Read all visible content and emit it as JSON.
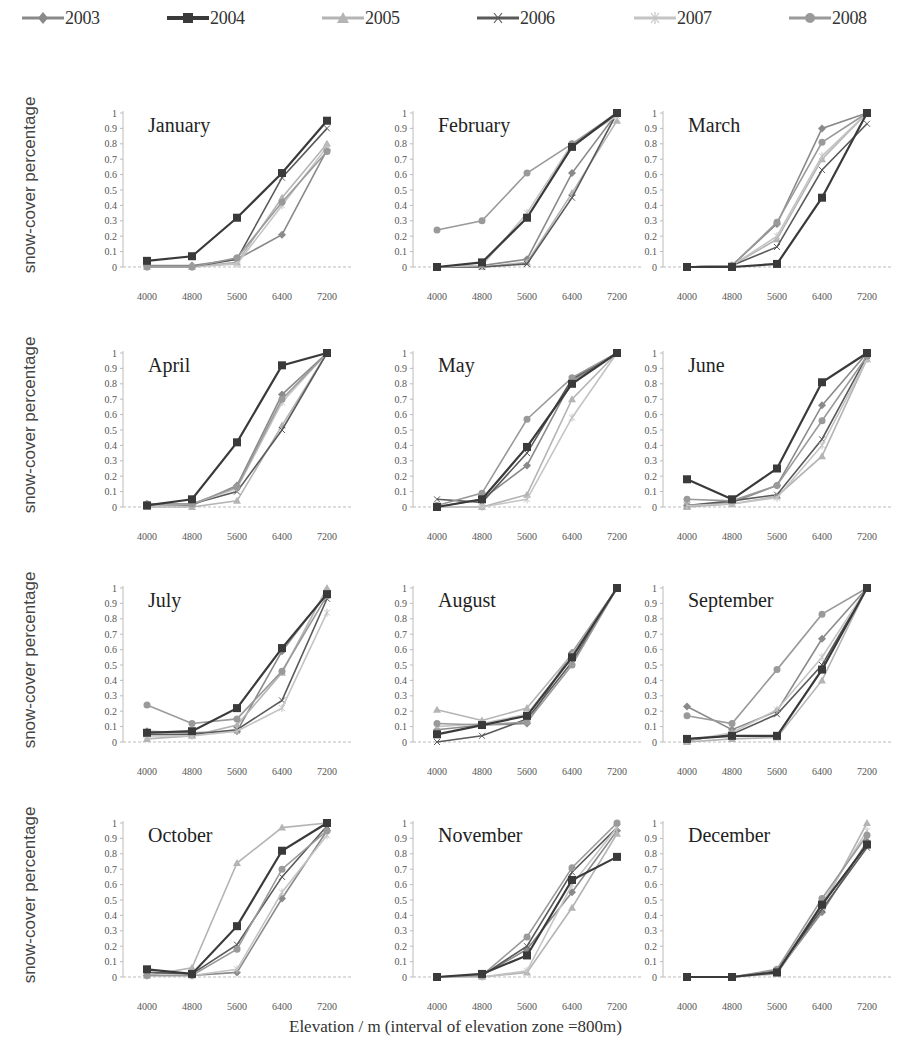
{
  "legend": {
    "items": [
      {
        "label": "2003",
        "color": "#8a8a8a",
        "marker": "diamond"
      },
      {
        "label": "2004",
        "color": "#3a3a3a",
        "marker": "square"
      },
      {
        "label": "2005",
        "color": "#b4b4b4",
        "marker": "triangle"
      },
      {
        "label": "2006",
        "color": "#5a5a5a",
        "marker": "x"
      },
      {
        "label": "2007",
        "color": "#c4c4c4",
        "marker": "star"
      },
      {
        "label": "2008",
        "color": "#9a9a9a",
        "marker": "circle"
      }
    ]
  },
  "ylabel": "snow-cover percentage",
  "xlabel": "Elevation / m (interval of elevation zone =800m)",
  "chart_data": {
    "type": "line",
    "layout": "small-multiples 4x3",
    "x": [
      4000,
      4800,
      5600,
      6400,
      7200
    ],
    "x_tick_labels": [
      "4000",
      "4800",
      "5600",
      "6400",
      "7200"
    ],
    "y_ticks": [
      "0",
      "0.1",
      "0.2",
      "0.3",
      "0.4",
      "0.5",
      "0.6",
      "0.7",
      "0.8",
      "0.9",
      "1"
    ],
    "ylim": [
      0,
      1
    ],
    "ylabel": "snow-cover percentage",
    "xlabel": "Elevation / m (interval of elevation zone =800m)",
    "legend_position": "top",
    "series_names": [
      "2003",
      "2004",
      "2005",
      "2006",
      "2007",
      "2008"
    ],
    "panels": [
      {
        "title": "January",
        "series": [
          {
            "name": "2003",
            "values": [
              0.01,
              0.01,
              0.05,
              0.21,
              0.76
            ]
          },
          {
            "name": "2004",
            "values": [
              0.04,
              0.07,
              0.32,
              0.61,
              0.95
            ]
          },
          {
            "name": "2005",
            "values": [
              0.0,
              0.0,
              0.03,
              0.45,
              0.8
            ]
          },
          {
            "name": "2006",
            "values": [
              0.0,
              0.0,
              0.05,
              0.58,
              0.9
            ]
          },
          {
            "name": "2007",
            "values": [
              0.0,
              0.0,
              0.02,
              0.4,
              0.78
            ]
          },
          {
            "name": "2008",
            "values": [
              0.0,
              0.0,
              0.06,
              0.42,
              0.75
            ]
          }
        ]
      },
      {
        "title": "February",
        "series": [
          {
            "name": "2003",
            "values": [
              0.0,
              0.01,
              0.05,
              0.61,
              1.0
            ]
          },
          {
            "name": "2004",
            "values": [
              0.0,
              0.03,
              0.32,
              0.78,
              1.0
            ]
          },
          {
            "name": "2005",
            "values": [
              0.0,
              0.0,
              0.03,
              0.48,
              0.95
            ]
          },
          {
            "name": "2006",
            "values": [
              0.0,
              0.0,
              0.02,
              0.45,
              1.0
            ]
          },
          {
            "name": "2007",
            "values": [
              0.0,
              0.01,
              0.35,
              0.8,
              0.98
            ]
          },
          {
            "name": "2008",
            "values": [
              0.24,
              0.3,
              0.61,
              0.8,
              1.0
            ]
          }
        ]
      },
      {
        "title": "March",
        "series": [
          {
            "name": "2003",
            "values": [
              0.0,
              0.01,
              0.28,
              0.9,
              1.0
            ]
          },
          {
            "name": "2004",
            "values": [
              0.0,
              0.0,
              0.02,
              0.45,
              1.0
            ]
          },
          {
            "name": "2005",
            "values": [
              0.0,
              0.01,
              0.18,
              0.7,
              1.0
            ]
          },
          {
            "name": "2006",
            "values": [
              0.0,
              0.01,
              0.13,
              0.63,
              0.93
            ]
          },
          {
            "name": "2007",
            "values": [
              0.0,
              0.01,
              0.2,
              0.72,
              1.0
            ]
          },
          {
            "name": "2008",
            "values": [
              0.0,
              0.01,
              0.29,
              0.81,
              1.0
            ]
          }
        ]
      },
      {
        "title": "April",
        "series": [
          {
            "name": "2003",
            "values": [
              0.02,
              0.01,
              0.14,
              0.73,
              1.0
            ]
          },
          {
            "name": "2004",
            "values": [
              0.01,
              0.05,
              0.42,
              0.92,
              1.0
            ]
          },
          {
            "name": "2005",
            "values": [
              0.0,
              0.0,
              0.04,
              0.53,
              1.0
            ]
          },
          {
            "name": "2006",
            "values": [
              0.01,
              0.02,
              0.1,
              0.5,
              1.0
            ]
          },
          {
            "name": "2007",
            "values": [
              0.01,
              0.02,
              0.12,
              0.68,
              1.0
            ]
          },
          {
            "name": "2008",
            "values": [
              0.02,
              0.02,
              0.13,
              0.7,
              1.0
            ]
          }
        ]
      },
      {
        "title": "May",
        "series": [
          {
            "name": "2003",
            "values": [
              0.0,
              0.05,
              0.27,
              0.82,
              1.0
            ]
          },
          {
            "name": "2004",
            "values": [
              0.0,
              0.05,
              0.39,
              0.8,
              1.0
            ]
          },
          {
            "name": "2005",
            "values": [
              0.0,
              0.0,
              0.08,
              0.7,
              1.0
            ]
          },
          {
            "name": "2006",
            "values": [
              0.05,
              0.03,
              0.35,
              0.83,
              1.0
            ]
          },
          {
            "name": "2007",
            "values": [
              0.0,
              0.0,
              0.05,
              0.58,
              1.0
            ]
          },
          {
            "name": "2008",
            "values": [
              0.01,
              0.09,
              0.57,
              0.84,
              1.0
            ]
          }
        ]
      },
      {
        "title": "June",
        "series": [
          {
            "name": "2003",
            "values": [
              0.01,
              0.03,
              0.14,
              0.66,
              1.0
            ]
          },
          {
            "name": "2004",
            "values": [
              0.18,
              0.05,
              0.25,
              0.81,
              1.0
            ]
          },
          {
            "name": "2005",
            "values": [
              0.0,
              0.02,
              0.07,
              0.33,
              0.96
            ]
          },
          {
            "name": "2006",
            "values": [
              0.01,
              0.04,
              0.08,
              0.44,
              0.98
            ]
          },
          {
            "name": "2007",
            "values": [
              0.01,
              0.02,
              0.06,
              0.4,
              0.96
            ]
          },
          {
            "name": "2008",
            "values": [
              0.05,
              0.04,
              0.14,
              0.56,
              0.98
            ]
          }
        ]
      },
      {
        "title": "July",
        "series": [
          {
            "name": "2003",
            "values": [
              0.07,
              0.06,
              0.07,
              0.59,
              0.97
            ]
          },
          {
            "name": "2004",
            "values": [
              0.06,
              0.07,
              0.22,
              0.61,
              0.96
            ]
          },
          {
            "name": "2005",
            "values": [
              0.02,
              0.04,
              0.11,
              0.45,
              1.0
            ]
          },
          {
            "name": "2006",
            "values": [
              0.05,
              0.05,
              0.08,
              0.27,
              0.93
            ]
          },
          {
            "name": "2007",
            "values": [
              0.04,
              0.04,
              0.07,
              0.22,
              0.84
            ]
          },
          {
            "name": "2008",
            "values": [
              0.24,
              0.12,
              0.15,
              0.46,
              0.95
            ]
          }
        ]
      },
      {
        "title": "August",
        "series": [
          {
            "name": "2003",
            "values": [
              0.08,
              0.11,
              0.12,
              0.58,
              1.0
            ]
          },
          {
            "name": "2004",
            "values": [
              0.05,
              0.11,
              0.17,
              0.55,
              1.0
            ]
          },
          {
            "name": "2005",
            "values": [
              0.21,
              0.14,
              0.22,
              0.57,
              1.0
            ]
          },
          {
            "name": "2006",
            "values": [
              0.0,
              0.04,
              0.15,
              0.52,
              1.0
            ]
          },
          {
            "name": "2007",
            "values": [
              0.1,
              0.12,
              0.18,
              0.55,
              1.0
            ]
          },
          {
            "name": "2008",
            "values": [
              0.12,
              0.11,
              0.13,
              0.5,
              1.0
            ]
          }
        ]
      },
      {
        "title": "September",
        "series": [
          {
            "name": "2003",
            "values": [
              0.23,
              0.08,
              0.2,
              0.67,
              1.0
            ]
          },
          {
            "name": "2004",
            "values": [
              0.02,
              0.04,
              0.04,
              0.47,
              1.0
            ]
          },
          {
            "name": "2005",
            "values": [
              0.0,
              0.02,
              0.03,
              0.4,
              1.0
            ]
          },
          {
            "name": "2006",
            "values": [
              0.01,
              0.05,
              0.18,
              0.5,
              1.0
            ]
          },
          {
            "name": "2007",
            "values": [
              0.01,
              0.06,
              0.21,
              0.55,
              1.0
            ]
          },
          {
            "name": "2008",
            "values": [
              0.17,
              0.12,
              0.47,
              0.83,
              1.0
            ]
          }
        ]
      },
      {
        "title": "October",
        "series": [
          {
            "name": "2003",
            "values": [
              0.01,
              0.01,
              0.03,
              0.51,
              0.95
            ]
          },
          {
            "name": "2004",
            "values": [
              0.05,
              0.02,
              0.33,
              0.82,
              1.0
            ]
          },
          {
            "name": "2005",
            "values": [
              0.01,
              0.06,
              0.74,
              0.97,
              1.0
            ]
          },
          {
            "name": "2006",
            "values": [
              0.03,
              0.02,
              0.21,
              0.65,
              0.98
            ]
          },
          {
            "name": "2007",
            "values": [
              0.01,
              0.01,
              0.05,
              0.55,
              0.92
            ]
          },
          {
            "name": "2008",
            "values": [
              0.01,
              0.01,
              0.18,
              0.7,
              0.95
            ]
          }
        ]
      },
      {
        "title": "November",
        "series": [
          {
            "name": "2003",
            "values": [
              0.0,
              0.01,
              0.18,
              0.55,
              0.95
            ]
          },
          {
            "name": "2004",
            "values": [
              0.0,
              0.02,
              0.14,
              0.63,
              0.78
            ]
          },
          {
            "name": "2005",
            "values": [
              0.0,
              0.0,
              0.03,
              0.45,
              0.93
            ]
          },
          {
            "name": "2006",
            "values": [
              0.0,
              0.01,
              0.2,
              0.68,
              0.97
            ]
          },
          {
            "name": "2007",
            "values": [
              0.0,
              0.0,
              0.04,
              0.6,
              0.97
            ]
          },
          {
            "name": "2008",
            "values": [
              0.0,
              0.01,
              0.26,
              0.71,
              1.0
            ]
          }
        ]
      },
      {
        "title": "December",
        "series": [
          {
            "name": "2003",
            "values": [
              0.0,
              0.0,
              0.03,
              0.42,
              0.88
            ]
          },
          {
            "name": "2004",
            "values": [
              0.0,
              0.0,
              0.03,
              0.47,
              0.86
            ]
          },
          {
            "name": "2005",
            "values": [
              0.0,
              0.0,
              0.02,
              0.45,
              1.0
            ]
          },
          {
            "name": "2006",
            "values": [
              0.0,
              0.0,
              0.04,
              0.44,
              0.84
            ]
          },
          {
            "name": "2007",
            "values": [
              0.0,
              0.0,
              0.03,
              0.48,
              0.95
            ]
          },
          {
            "name": "2008",
            "values": [
              0.0,
              0.0,
              0.05,
              0.51,
              0.92
            ]
          }
        ]
      }
    ]
  }
}
